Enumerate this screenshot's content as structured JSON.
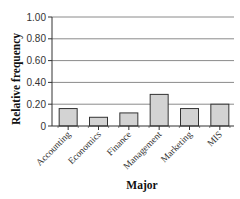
{
  "chart_data": {
    "type": "bar",
    "title": "",
    "xlabel": "Major",
    "ylabel": "Relative frequency",
    "categories": [
      "Accounting",
      "Economics",
      "Finance",
      "Management",
      "Marketing",
      "MIS"
    ],
    "values": [
      0.16,
      0.08,
      0.12,
      0.29,
      0.16,
      0.2
    ],
    "ylim": [
      0,
      1.0
    ],
    "yticks": [
      0,
      0.2,
      0.4,
      0.6,
      0.8,
      1.0
    ],
    "ytick_labels": [
      "0",
      "0.20",
      "0.40",
      "0.60",
      "0.80",
      "1.00"
    ],
    "grid": true,
    "legend": null
  },
  "colors": {
    "bar_fill": "#d3d3d3",
    "bar_stroke": "#333333",
    "grid": "#8a8a8a",
    "axis": "#333333"
  }
}
